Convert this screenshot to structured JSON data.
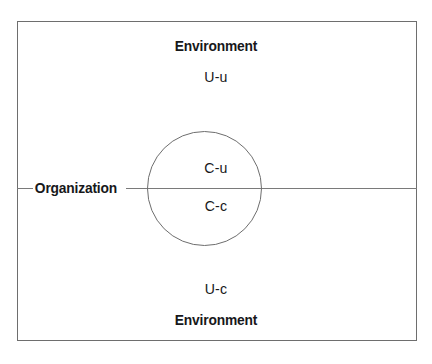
{
  "diagram": {
    "type": "organization-environment-venn",
    "frame": {
      "name": "outer-boundary",
      "border_color": "#6e6e6e"
    },
    "divider": {
      "name": "organization-environment-boundary",
      "color": "#7a7a7a",
      "orientation": "horizontal"
    },
    "circle": {
      "name": "core-domain-circle",
      "border_color": "#6e6e6e"
    },
    "labels": {
      "environment_top": "Environment",
      "u_u": "U-u",
      "organization": "Organization",
      "c_u": "C-u",
      "c_c": "C-c",
      "u_c": "U-c",
      "environment_bottom": "Environment"
    }
  }
}
